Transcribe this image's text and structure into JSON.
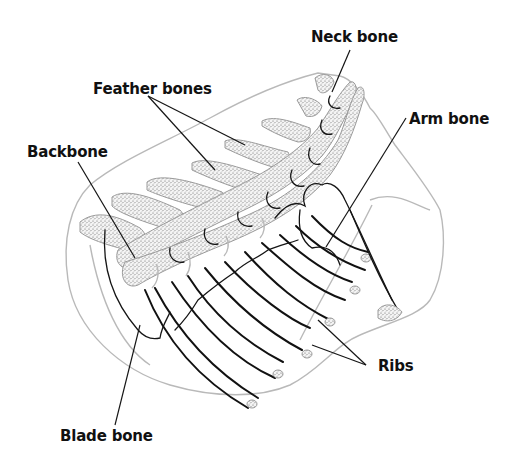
{
  "figure": {
    "title_fragment": ""
  },
  "labels": {
    "neck_bone": "Neck bone",
    "feather_bones": "Feather bones",
    "arm_bone": "Arm bone",
    "backbone": "Backbone",
    "ribs": "Ribs",
    "blade_bone": "Blade bone"
  },
  "colors": {
    "ink": "#151515",
    "outline": "#b9b9b9",
    "stipple": "#6e6e6e",
    "background": "#ffffff"
  }
}
